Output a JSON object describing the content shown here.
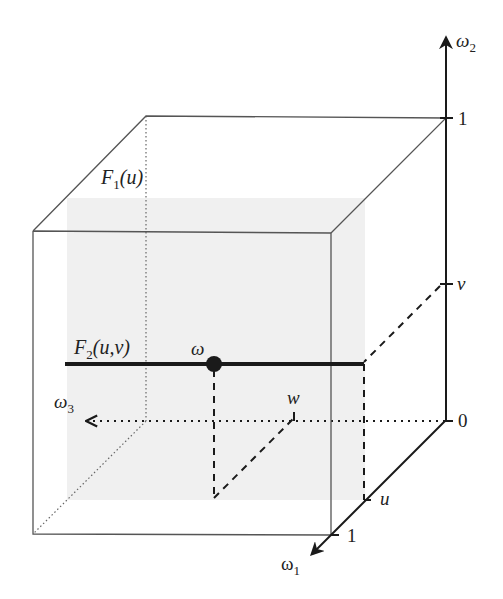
{
  "diagram": {
    "title": "",
    "colors": {
      "ink": "#1a1a1a",
      "cube_edge": "#555555",
      "shade": "#f0f0f0"
    },
    "axes": {
      "omega1": {
        "name": "ω",
        "sub": "1"
      },
      "omega2": {
        "name": "ω",
        "sub": "2"
      },
      "omega3": {
        "name": "ω",
        "sub": "3"
      }
    },
    "ticks": {
      "vertical_one": "1",
      "vertical_v": "v",
      "origin_zero": "0",
      "depth_u": "u",
      "depth_one": "1",
      "w_mark": "w"
    },
    "labels": {
      "f1": {
        "name": "F",
        "sub": "1",
        "args": "(u)"
      },
      "f2": {
        "name": "F",
        "sub": "2",
        "args": "(u,v)"
      },
      "point": "ω"
    }
  }
}
